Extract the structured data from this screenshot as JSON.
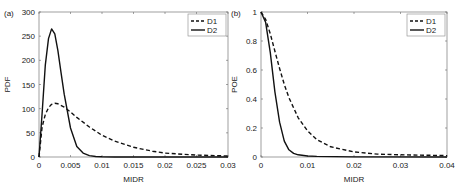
{
  "chart_data": [
    {
      "type": "line",
      "panel_label": "(a)",
      "title": "",
      "xlabel": "MIDR",
      "ylabel": "PDF",
      "xlim": [
        0,
        0.03
      ],
      "ylim": [
        0,
        300
      ],
      "xticks": [
        "0",
        "0.005",
        "0.01",
        "0.015",
        "0.02",
        "0.025",
        "0.03"
      ],
      "yticks": [
        "0",
        "50",
        "100",
        "150",
        "200",
        "250",
        "300"
      ],
      "grid": false,
      "legend_position": "upper right",
      "series": [
        {
          "name": "D1",
          "style": "dashed",
          "x": [
            0,
            0.0005,
            0.001,
            0.0015,
            0.002,
            0.0025,
            0.003,
            0.004,
            0.005,
            0.006,
            0.008,
            0.01,
            0.012,
            0.015,
            0.018,
            0.02,
            0.025,
            0.03
          ],
          "y": [
            0,
            62,
            88,
            102,
            109,
            111,
            110,
            103,
            93,
            82,
            62,
            45,
            33,
            20,
            12,
            8,
            4,
            2
          ]
        },
        {
          "name": "D2",
          "style": "solid",
          "x": [
            0,
            0.0005,
            0.001,
            0.0015,
            0.002,
            0.0025,
            0.003,
            0.0035,
            0.004,
            0.005,
            0.006,
            0.007,
            0.008,
            0.009,
            0.01,
            0.012,
            0.015,
            0.03
          ],
          "y": [
            0,
            90,
            190,
            245,
            265,
            255,
            220,
            175,
            130,
            60,
            22,
            8,
            3,
            1,
            0.5,
            0,
            0,
            0
          ]
        }
      ]
    },
    {
      "type": "line",
      "panel_label": "(b)",
      "title": "",
      "xlabel": "MIDR",
      "ylabel": "POE",
      "xlim": [
        0,
        0.04
      ],
      "ylim": [
        0,
        1
      ],
      "xticks": [
        "0",
        "0.01",
        "0.02",
        "0.03",
        "0.04"
      ],
      "yticks": [
        "0",
        "0.2",
        "0.4",
        "0.6",
        "0.8",
        "1"
      ],
      "grid": false,
      "legend_position": "upper right",
      "series": [
        {
          "name": "D1",
          "style": "dashed",
          "x": [
            0,
            0.001,
            0.002,
            0.003,
            0.004,
            0.005,
            0.006,
            0.008,
            0.01,
            0.012,
            0.015,
            0.02,
            0.025,
            0.03,
            0.04
          ],
          "y": [
            1,
            0.95,
            0.85,
            0.73,
            0.61,
            0.5,
            0.41,
            0.27,
            0.18,
            0.12,
            0.07,
            0.035,
            0.02,
            0.015,
            0.01
          ]
        },
        {
          "name": "D2",
          "style": "solid",
          "x": [
            0,
            0.001,
            0.002,
            0.003,
            0.004,
            0.005,
            0.006,
            0.007,
            0.008,
            0.01,
            0.012,
            0.02,
            0.04
          ],
          "y": [
            1,
            0.93,
            0.72,
            0.45,
            0.24,
            0.11,
            0.05,
            0.025,
            0.015,
            0.007,
            0.004,
            0.001,
            0
          ]
        }
      ]
    }
  ]
}
